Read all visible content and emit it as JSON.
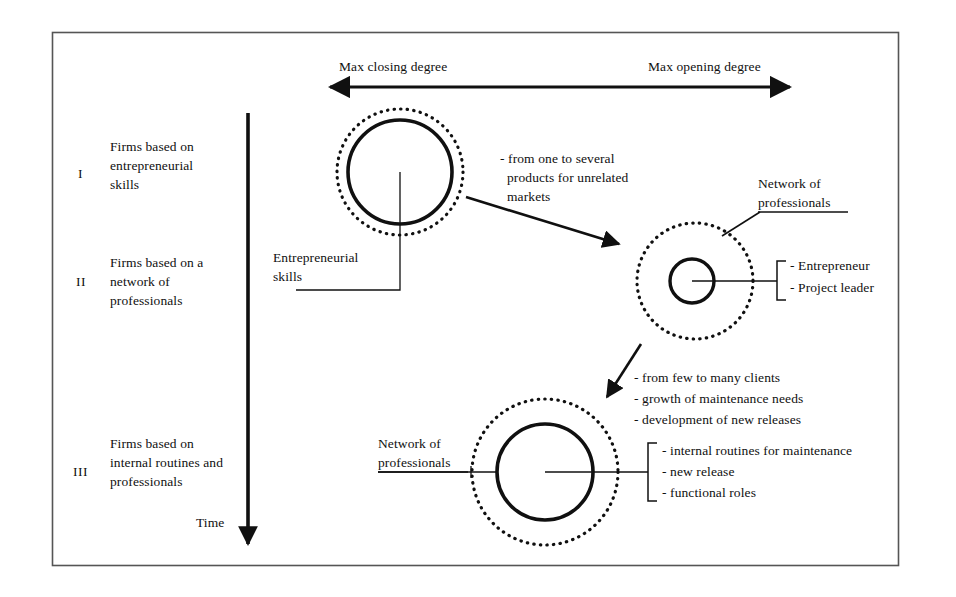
{
  "figure": {
    "kind": "process-evolution-diagram",
    "border_color": "#4a4a4a",
    "ink_color": "#101010"
  },
  "axis": {
    "left_label": "Max closing degree",
    "right_label": "Max opening degree"
  },
  "time_axis": {
    "label": "Time"
  },
  "stages": [
    {
      "numeral": "I",
      "label": "Firms based on\nentrepreneurial\nskills"
    },
    {
      "numeral": "II",
      "label": "Firms based on a\nnetwork of\nprofessionals"
    },
    {
      "numeral": "III",
      "label": "Firms based on\ninternal routines and\nprofessionals"
    }
  ],
  "callouts": {
    "stage1_core": "Entrepreneurial\nskills",
    "stage2_outer": "Network of\nprofessionals",
    "stage2_roles": [
      "- Entrepreneur",
      "- Project leader"
    ],
    "stage3_outer": "Network of\nprofessionals",
    "stage3_items": [
      "- internal routines for maintenance",
      "- new release",
      "- functional roles"
    ]
  },
  "transitions": [
    {
      "id": "t1",
      "lines": [
        "- from one to several",
        "products for unrelated",
        "markets"
      ]
    },
    {
      "id": "t2",
      "lines": [
        "- from few to many clients",
        "- growth of maintenance needs",
        "- development of new releases"
      ]
    }
  ]
}
